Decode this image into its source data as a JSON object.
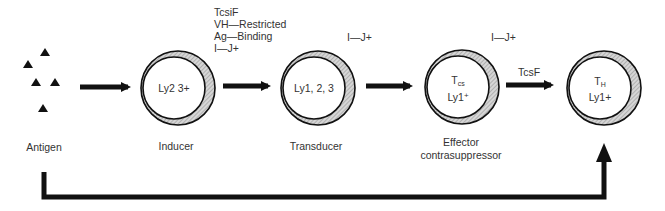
{
  "antigen": {
    "label": "Antigen",
    "triangle_count": 5
  },
  "cells": [
    {
      "id": "inducer",
      "lines": [
        "Ly2 3+"
      ],
      "label": "Inducer"
    },
    {
      "id": "transducer",
      "lines": [
        "Ly1, 2, 3"
      ],
      "label": "Transducer",
      "above": "I—J+"
    },
    {
      "id": "effector",
      "main": "T",
      "sub": "cs",
      "line2_main": "Ly1",
      "line2_sup": "+",
      "label_line1": "Effector",
      "label_line2": "contrasuppressor",
      "above": "I—J+"
    },
    {
      "id": "helper",
      "main": "T",
      "sub": "H",
      "line2": "Ly1+"
    }
  ],
  "factor_block": [
    "TcsiF",
    "VH—Restricted",
    "Ag—Binding",
    "I—J+"
  ],
  "arrow_labels": {
    "effector_to_helper": "TcsF"
  },
  "colors": {
    "line": "#111111",
    "shade": "#b8b8b8",
    "text": "#333333"
  }
}
